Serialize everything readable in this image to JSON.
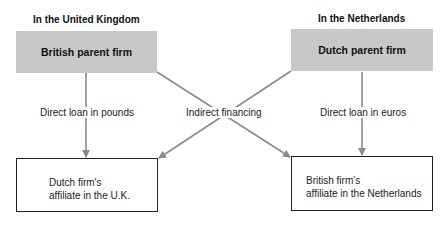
{
  "diagram": {
    "regions": {
      "uk": {
        "heading": "In the United Kingdom",
        "parent_firm": "British parent firm",
        "affiliate_line1": "Dutch firm's",
        "affiliate_line2": "affiliate in the U.K."
      },
      "nl": {
        "heading": "In the Netherlands",
        "parent_firm": "Dutch parent firm",
        "affiliate_line1": "British firm's",
        "affiliate_line2": "affiliate in the Netherlands"
      }
    },
    "flows": {
      "direct_uk": "Direct loan in pounds",
      "indirect": "Indirect financing",
      "direct_nl": "Direct loan in euros"
    },
    "colors": {
      "parent_fill": "#c8c8c8",
      "arrow": "#8a8a8a",
      "affiliate_border": "#222222"
    }
  }
}
